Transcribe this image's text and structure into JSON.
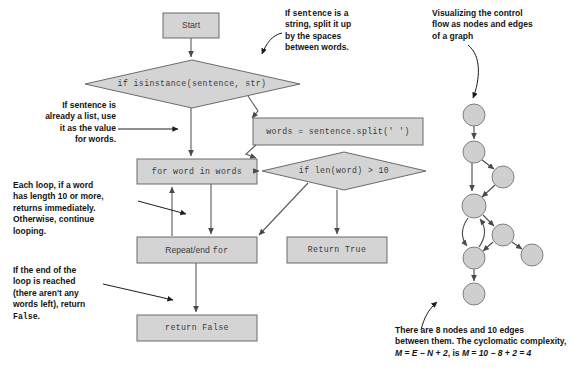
{
  "figure": {
    "kind": "flowchart-with-graph",
    "shape_fill": "#d4d4d4",
    "shape_stroke": "#6b6b6b",
    "node_fill": "#cfcfcf",
    "node_stroke": "#808080",
    "text_color": "#3b3b3b",
    "callout_color": "#141414",
    "edge_color": "#5a5a5a"
  },
  "flowchart": {
    "nodes": [
      {
        "id": "start",
        "label": "Start",
        "shape": "rect",
        "font": "sans"
      },
      {
        "id": "isinstance",
        "label": "if isinstance(sentence, str)",
        "shape": "diamond",
        "font": "mono"
      },
      {
        "id": "split",
        "label": "words = sentence.split(' ')",
        "shape": "rect",
        "font": "mono"
      },
      {
        "id": "forword",
        "label": "for word in words",
        "shape": "rect",
        "font": "mono"
      },
      {
        "id": "lencheck",
        "label": "if len(word) > 10",
        "shape": "diamond",
        "font": "mono"
      },
      {
        "id": "repeatend",
        "label_sans": "Repeat/end",
        "label_mono": "for",
        "shape": "rect",
        "font": "mixed"
      },
      {
        "id": "returntrue",
        "label": "Return True",
        "shape": "rect",
        "font": "mono"
      },
      {
        "id": "returnfalse",
        "label": "return False",
        "shape": "rect",
        "font": "mono"
      }
    ],
    "edges": [
      {
        "from": "start",
        "to": "isinstance"
      },
      {
        "from": "isinstance",
        "to": "split"
      },
      {
        "from": "isinstance",
        "to": "forword"
      },
      {
        "from": "split",
        "to": "forword"
      },
      {
        "from": "forword",
        "to": "lencheck"
      },
      {
        "from": "forword",
        "to": "repeatend"
      },
      {
        "from": "lencheck",
        "to": "repeatend"
      },
      {
        "from": "lencheck",
        "to": "returntrue"
      },
      {
        "from": "repeatend",
        "to": "forword"
      },
      {
        "from": "repeatend",
        "to": "returnfalse"
      }
    ]
  },
  "callouts": {
    "split_note": {
      "lines": [
        "If sentence is a",
        "string, split it up",
        "by the spaces",
        "between words."
      ],
      "emphasis_word": "sentence",
      "align": "left"
    },
    "list_note": {
      "lines": [
        "If sentence is",
        "already a list, use",
        "it as the value",
        "for words."
      ],
      "align": "right"
    },
    "loop_note": {
      "lines": [
        "Each loop, if a word",
        "has length 10 or more,",
        "returns immediately.",
        "Otherwise, continue",
        "looping."
      ],
      "align": "left"
    },
    "end_note": {
      "lines": [
        "If the end of the",
        "loop is reached",
        "(there aren't any",
        "words left), return",
        "False."
      ],
      "align": "left"
    },
    "graph_note": {
      "lines": [
        "Visualizing the control",
        "flow as nodes and edges",
        "of a graph"
      ],
      "align": "left"
    },
    "complexity_note": {
      "lines": [
        "There are 8 nodes and 10 edges",
        "between them. The cyclomatic complexity,",
        "M = E − N + 2, is M = 10 − 8 + 2 = 4."
      ],
      "align": "left",
      "node_count": 8,
      "edge_count": 10,
      "formula": "M = E − N + 2",
      "result": "M = 10 − 8 + 2 = 4"
    }
  },
  "graph": {
    "node_count": 8,
    "edge_count": 10,
    "nodes": [
      {
        "id": "g1",
        "cx": 474,
        "cy": 115,
        "r": 11
      },
      {
        "id": "g2",
        "cx": 474,
        "cy": 152,
        "r": 11
      },
      {
        "id": "g3",
        "cx": 503,
        "cy": 177,
        "r": 11
      },
      {
        "id": "g4",
        "cx": 474,
        "cy": 206,
        "r": 12
      },
      {
        "id": "g5",
        "cx": 503,
        "cy": 235,
        "r": 11
      },
      {
        "id": "g6",
        "cx": 532,
        "cy": 255,
        "r": 11
      },
      {
        "id": "g7",
        "cx": 474,
        "cy": 258,
        "r": 11
      },
      {
        "id": "g8",
        "cx": 474,
        "cy": 294,
        "r": 11
      }
    ],
    "edges": [
      [
        "g1",
        "g2"
      ],
      [
        "g2",
        "g3"
      ],
      [
        "g2",
        "g4"
      ],
      [
        "g3",
        "g4"
      ],
      [
        "g4",
        "g5"
      ],
      [
        "g4",
        "g7"
      ],
      [
        "g5",
        "g6"
      ],
      [
        "g5",
        "g7"
      ],
      [
        "g7",
        "g4"
      ],
      [
        "g7",
        "g8"
      ]
    ]
  }
}
